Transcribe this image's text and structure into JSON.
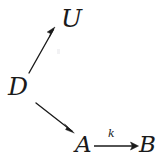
{
  "diagram": {
    "type": "commutative-diagram",
    "background_color": "#ffffff",
    "ink_color": "#1a1a1a",
    "nodes": [
      {
        "id": "U",
        "label": "U",
        "x": 74,
        "y": 19
      },
      {
        "id": "D",
        "label": "D",
        "x": 20,
        "y": 87
      },
      {
        "id": "A",
        "label": "A",
        "x": 84,
        "y": 145
      },
      {
        "id": "B",
        "label": "B",
        "x": 147,
        "y": 145
      }
    ],
    "edges": [
      {
        "id": "D-to-U",
        "from": "D",
        "to": "U",
        "label": "",
        "direction": "up-right",
        "x1": 29,
        "y1": 73,
        "x2": 55,
        "y2": 28
      },
      {
        "id": "D-to-A",
        "from": "D",
        "to": "A",
        "label": "",
        "direction": "down-right",
        "x1": 36,
        "y1": 103,
        "x2": 74,
        "y2": 133
      },
      {
        "id": "A-to-B",
        "from": "A",
        "to": "B",
        "label": "k",
        "direction": "right",
        "x1": 94,
        "y1": 146,
        "x2": 138,
        "y2": 146
      }
    ]
  }
}
